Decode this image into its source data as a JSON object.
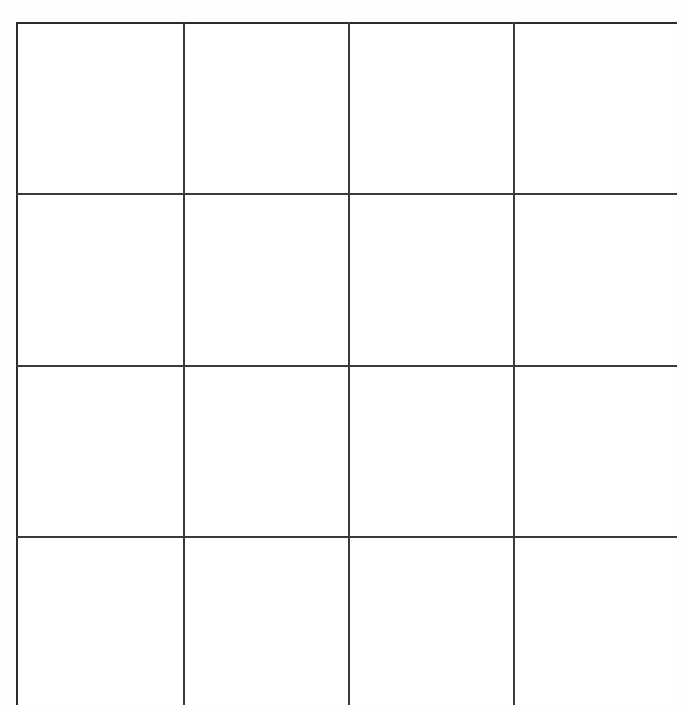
{
  "page": {
    "width": 688,
    "height": 710,
    "background_color": "#ffffff"
  },
  "grid": {
    "kind": "blank-grid-worksheet",
    "rows": 4,
    "columns": 4,
    "cell_count": 16,
    "all_cells_empty": true,
    "border_color": "#2b2b2b",
    "rule_color": "#3a3a3a",
    "cell_fill_color": "#ffffff",
    "outer_border_width_px": 4,
    "interior_rule_width_px": 2,
    "bounds": {
      "left": 16,
      "top": 22,
      "right": 677,
      "bottom": 705,
      "width": 661,
      "height": 683
    },
    "vertical_rule_positions": [
      167,
      332,
      497
    ],
    "horizontal_rule_positions": [
      171,
      343,
      514
    ],
    "column_labels": [
      "",
      "",
      "",
      ""
    ],
    "row_labels": [
      "",
      "",
      "",
      ""
    ],
    "cells": [
      [
        {
          "text": ""
        },
        {
          "text": ""
        },
        {
          "text": ""
        },
        {
          "text": ""
        }
      ],
      [
        {
          "text": ""
        },
        {
          "text": ""
        },
        {
          "text": ""
        },
        {
          "text": ""
        }
      ],
      [
        {
          "text": ""
        },
        {
          "text": ""
        },
        {
          "text": ""
        },
        {
          "text": ""
        }
      ],
      [
        {
          "text": ""
        },
        {
          "text": ""
        },
        {
          "text": ""
        },
        {
          "text": ""
        }
      ]
    ]
  }
}
